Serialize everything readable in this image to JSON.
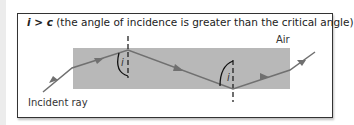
{
  "title": {
    "condition": "i > c",
    "text": " (the angle of incidence is greater than the critical angle)"
  },
  "labels": {
    "medium_outside": "Air",
    "incident_ray": "Incident ray",
    "angle_top": "i",
    "angle_bottom": "i"
  },
  "colors": {
    "block": "#b8b8b8",
    "ray": "#707070",
    "frame": "#333333"
  }
}
